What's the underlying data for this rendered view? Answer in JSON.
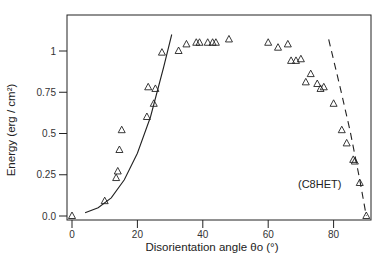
{
  "chart_data": {
    "type": "scatter",
    "title": "",
    "xlabel": "Disorientation angle θo (°)",
    "ylabel": "Energy (erg / cm²)",
    "xlim": [
      -1,
      91
    ],
    "ylim": [
      -0.02,
      1.25
    ],
    "xticks": [
      0,
      20,
      40,
      60,
      80
    ],
    "yticks": [
      0.0,
      0.25,
      0.5,
      0.75,
      1
    ],
    "ytick_labels": [
      "0.0",
      "0.25",
      "0.5",
      "0.75",
      "1"
    ],
    "grid": false,
    "annotation": "(C8HET)",
    "series": [
      {
        "name": "measured",
        "marker": "triangle",
        "x": [
          0,
          10,
          13.5,
          14,
          14.5,
          15.2,
          22.9,
          23.3,
          25,
          25.5,
          27.5,
          32.6,
          35,
          38,
          39,
          41.5,
          43,
          44,
          48,
          60,
          63,
          66,
          67,
          68.5,
          70,
          71.5,
          73,
          75,
          76,
          77,
          80,
          82.5,
          84,
          86,
          86.5,
          88,
          90
        ],
        "y": [
          0.0,
          0.09,
          0.23,
          0.27,
          0.4,
          0.52,
          0.6,
          0.78,
          0.68,
          0.77,
          0.99,
          1.0,
          1.04,
          1.05,
          1.05,
          1.05,
          1.05,
          1.05,
          1.07,
          1.05,
          1.02,
          1.04,
          0.94,
          0.94,
          0.95,
          0.81,
          0.86,
          0.8,
          0.77,
          0.78,
          0.68,
          0.52,
          0.44,
          0.34,
          0.33,
          0.2,
          0.0
        ]
      },
      {
        "name": "fit (low angle)",
        "style": "solid-line",
        "x": [
          4,
          8,
          12,
          16,
          20,
          24,
          28,
          30.5
        ],
        "y": [
          0.02,
          0.05,
          0.11,
          0.22,
          0.38,
          0.6,
          0.9,
          1.1
        ]
      },
      {
        "name": "fit (high angle)",
        "style": "dashed-line",
        "x": [
          78.5,
          82,
          85,
          88,
          90
        ],
        "y": [
          1.07,
          0.78,
          0.52,
          0.22,
          0.0
        ]
      }
    ]
  }
}
